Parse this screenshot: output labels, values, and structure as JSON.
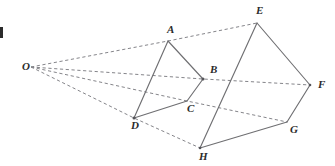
{
  "figure": {
    "kind": "geometry-diagram",
    "canvas": {
      "width": 335,
      "height": 166,
      "background": "#ffffff"
    },
    "style": {
      "solid_edge_color": "#6f6f72",
      "dashed_edge_color": "#85858a",
      "label_color": "#2b2b2b",
      "solid_edge_width": 1.15,
      "dashed_edge_width": 1.0,
      "dash_pattern": "3.2 2.6"
    },
    "points": [
      {
        "id": "O",
        "label": "O",
        "x": 31,
        "y": 67,
        "label_x": 22,
        "label_y": 70
      },
      {
        "id": "A",
        "label": "A",
        "x": 168,
        "y": 41,
        "label_x": 167,
        "label_y": 33
      },
      {
        "id": "B",
        "label": "B",
        "x": 203,
        "y": 79,
        "label_x": 210,
        "label_y": 73
      },
      {
        "id": "C",
        "label": "C",
        "x": 187,
        "y": 101,
        "label_x": 187,
        "label_y": 112
      },
      {
        "id": "D",
        "label": "D",
        "x": 134,
        "y": 118,
        "label_x": 131,
        "label_y": 129
      },
      {
        "id": "E",
        "label": "E",
        "x": 257,
        "y": 23,
        "label_x": 256,
        "label_y": 14
      },
      {
        "id": "F",
        "label": "F",
        "x": 310,
        "y": 85,
        "label_x": 318,
        "label_y": 88
      },
      {
        "id": "G",
        "label": "G",
        "x": 287,
        "y": 122,
        "label_x": 290,
        "label_y": 133
      },
      {
        "id": "H",
        "label": "H",
        "x": 200,
        "y": 148,
        "label_x": 199,
        "label_y": 160
      }
    ],
    "solid_edges": [
      {
        "id": "edge-AB",
        "from": "A",
        "to": "B"
      },
      {
        "id": "edge-BC",
        "from": "B",
        "to": "C"
      },
      {
        "id": "edge-CD",
        "from": "C",
        "to": "D"
      },
      {
        "id": "edge-DA",
        "from": "D",
        "to": "A"
      },
      {
        "id": "edge-EF",
        "from": "E",
        "to": "F"
      },
      {
        "id": "edge-FG",
        "from": "F",
        "to": "G"
      },
      {
        "id": "edge-GH",
        "from": "G",
        "to": "H"
      },
      {
        "id": "edge-HE",
        "from": "H",
        "to": "E"
      }
    ],
    "dashed_rays": [
      {
        "id": "ray-O-A-E",
        "from": "O",
        "through": "A",
        "to": "E"
      },
      {
        "id": "ray-O-B-F",
        "from": "O",
        "through": "B",
        "to": "F"
      },
      {
        "id": "ray-O-C-G",
        "from": "O",
        "through": "C",
        "to": "G"
      },
      {
        "id": "ray-O-D-H",
        "from": "O",
        "through": "D",
        "to": "H"
      }
    ],
    "crop_fragment": {
      "id": "left-edge-text-fragment",
      "x": 0,
      "y": 27,
      "width": 3,
      "height": 11
    }
  }
}
